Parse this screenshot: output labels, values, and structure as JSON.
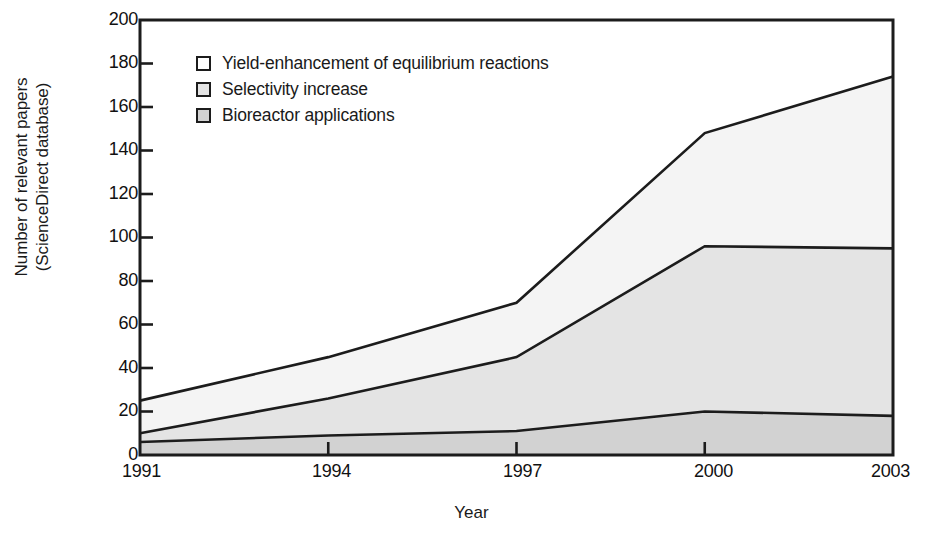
{
  "chart_data": {
    "type": "area",
    "stacked": true,
    "title": "",
    "subtitle": "",
    "xlabel": "Year",
    "ylabel": "Number of relevant papers (ScienceDirect database)",
    "ylabel_lines": [
      "Number of relevant papers",
      "(ScienceDirect database)"
    ],
    "x": [
      1991,
      1994,
      1997,
      2000,
      2003
    ],
    "categories": [
      "1991",
      "1994",
      "1997",
      "2000",
      "2003"
    ],
    "xtick_labels": [
      "1991",
      "1994",
      "1997",
      "2000",
      "2003"
    ],
    "ytick_labels": [
      "0",
      "20",
      "40",
      "60",
      "80",
      "100",
      "120",
      "140",
      "160",
      "180",
      "200"
    ],
    "ytick_values": [
      0,
      20,
      40,
      60,
      80,
      100,
      120,
      140,
      160,
      180,
      200
    ],
    "xlim": [
      1991,
      2003
    ],
    "ylim": [
      0,
      200
    ],
    "grid": false,
    "legend_position": "upper-left-inside",
    "series": [
      {
        "name": "Bioreactor applications",
        "values": [
          6,
          9,
          11,
          20,
          18
        ],
        "color": "#d2d2d2",
        "legend_swatch": "#d2d2d2"
      },
      {
        "name": "Selectivity increase",
        "values": [
          10,
          26,
          45,
          96,
          95
        ],
        "cumulative": [
          10,
          26,
          45,
          96,
          95
        ],
        "color": "#e4e4e4",
        "legend_swatch": "#e4e4e4"
      },
      {
        "name": "Yield-enhancement of equilibrium reactions",
        "values": [
          25,
          45,
          70,
          148,
          174
        ],
        "cumulative": [
          25,
          45,
          70,
          148,
          174
        ],
        "color": "#f4f4f4",
        "legend_swatch": "#ffffff"
      }
    ],
    "line_color": "#1c1c1c",
    "axis_color": "#1c1c1c",
    "background": "#ffffff"
  },
  "legend": {
    "items": [
      {
        "label": "Yield-enhancement of equilibrium reactions",
        "swatch": "#ffffff"
      },
      {
        "label": "Selectivity increase",
        "swatch": "#e4e4e4"
      },
      {
        "label": "Bioreactor applications",
        "swatch": "#d2d2d2"
      }
    ]
  },
  "axes": {
    "x_title": "Year",
    "y_title_line1": "Number of relevant papers",
    "y_title_line2": "(ScienceDirect database)"
  }
}
